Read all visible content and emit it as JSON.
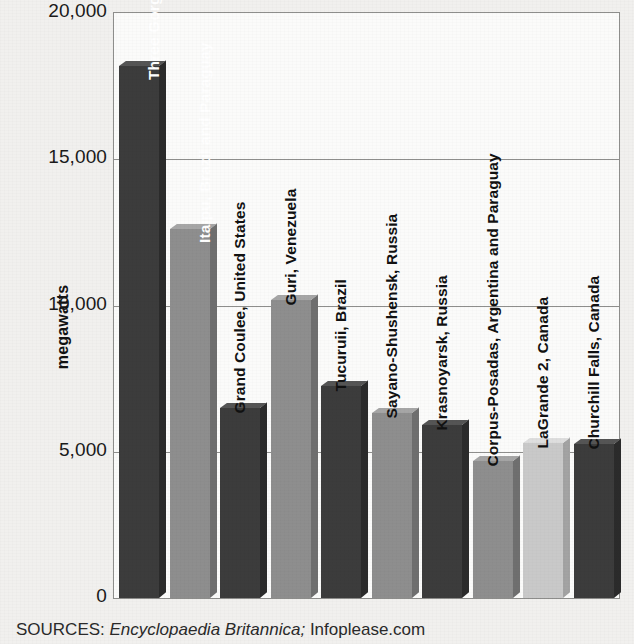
{
  "chart_data": {
    "type": "bar",
    "title": "",
    "xlabel": "",
    "ylabel": "megawatts",
    "ylim": [
      0,
      20000
    ],
    "grid": true,
    "legend": "none",
    "categories": [
      "Three Gorges, China",
      "Itaipu, Brazil and Paraguay",
      "Grand Coulee, United States",
      "Guri, Venezuela",
      "Tucuruii, Brazil",
      "Sayano-Shushensk, Russia",
      "Krasnoyarsk, Russia",
      "Corpus-Posadas, Argentina and Paraguay",
      "LaGrande 2, Canada",
      "Churchill Falls, Canada"
    ],
    "values": [
      18200,
      12600,
      6480,
      10200,
      7260,
      6340,
      5900,
      4700,
      5300,
      5270
    ],
    "yticks": [
      {
        "value": 20000,
        "label": "20,000"
      },
      {
        "value": 15000,
        "label": "15,000"
      },
      {
        "value": 10000,
        "label": "10,000"
      },
      {
        "value": 5000,
        "label": "5,000"
      },
      {
        "value": 0,
        "label": "0"
      }
    ],
    "bars": [
      {
        "name": "Three Gorges, China",
        "value": 18200,
        "color": "#3c3c3c",
        "shade": "dark",
        "label_placement": "inside"
      },
      {
        "name": "Itaipu, Brazil and Paraguay",
        "value": 12600,
        "color": "#8e8e8e",
        "shade": "light",
        "label_placement": "inside"
      },
      {
        "name": "Grand Coulee, United States",
        "value": 6480,
        "color": "#3c3c3c",
        "shade": "dark",
        "label_placement": "outside"
      },
      {
        "name": "Guri, Venezuela",
        "value": 10200,
        "color": "#8e8e8e",
        "shade": "light",
        "label_placement": "outside"
      },
      {
        "name": "Tucuruii, Brazil",
        "value": 7260,
        "color": "#3c3c3c",
        "shade": "dark",
        "label_placement": "outside"
      },
      {
        "name": "Sayano-Shushensk, Russia",
        "value": 6340,
        "color": "#8e8e8e",
        "shade": "light",
        "label_placement": "outside"
      },
      {
        "name": "Krasnoyarsk, Russia",
        "value": 5900,
        "color": "#3c3c3c",
        "shade": "dark",
        "label_placement": "outside"
      },
      {
        "name": "Corpus-Posadas, Argentina and Paraguay",
        "value": 4700,
        "color": "#8e8e8e",
        "shade": "light",
        "label_placement": "outside"
      },
      {
        "name": "LaGrande 2, Canada",
        "value": 5300,
        "color": "#c9c9c9",
        "shade": "light",
        "label_placement": "outside"
      },
      {
        "name": "Churchill Falls, Canada",
        "value": 5270,
        "color": "#3c3c3c",
        "shade": "dark",
        "label_placement": "outside"
      }
    ]
  },
  "footer": {
    "sources_label": "SOURCES:",
    "source_italic": "Encyclopaedia Britannica;",
    "source_plain": "Infoplease.com"
  },
  "colors": {
    "bar_dark": "#3c3c3c",
    "bar_light": "#8e8e8e",
    "bar_pale": "#c9c9c9",
    "plot_background": "#fbfbfa",
    "page_background": "#f1f0ee",
    "axis": "#8e8e8c",
    "text": "#111111"
  }
}
